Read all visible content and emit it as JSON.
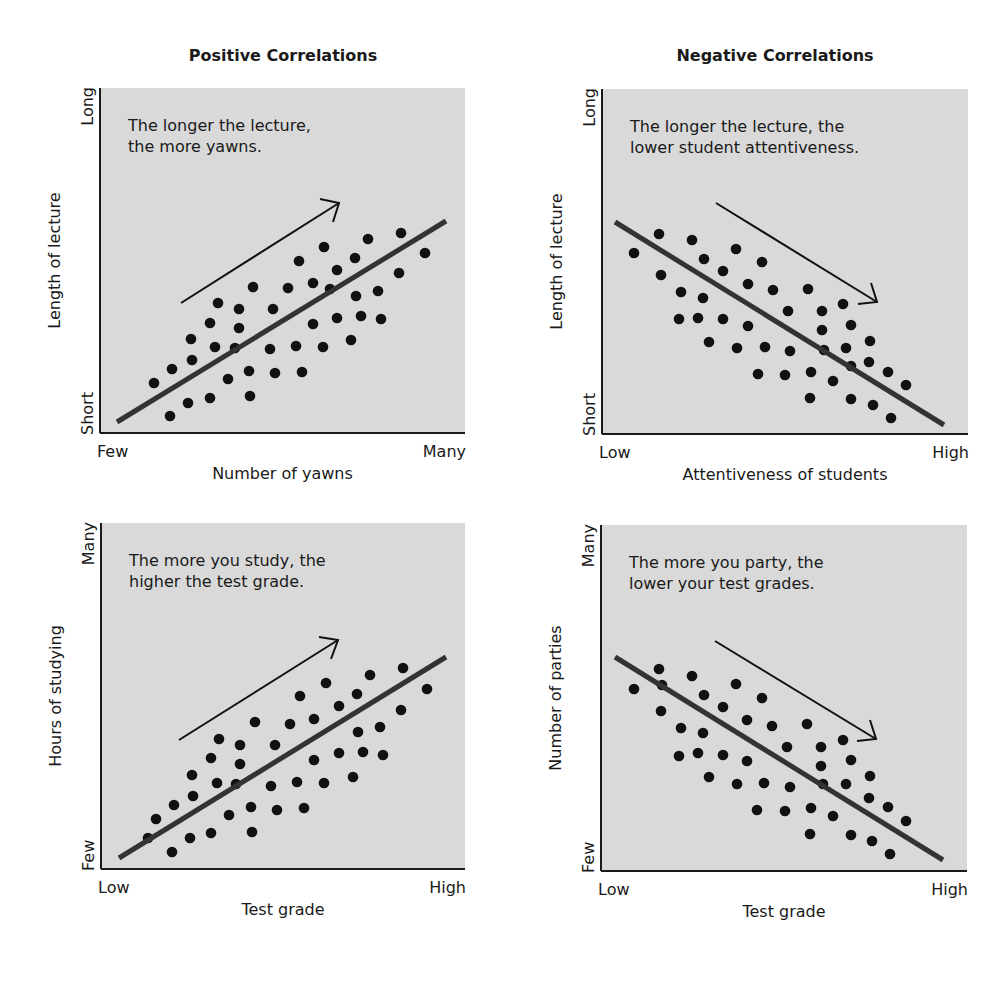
{
  "columns": [
    {
      "title": "Positive Correlations"
    },
    {
      "title": "Negative Correlations"
    }
  ],
  "style": {
    "panel_bg": "#d9d9d9",
    "axis_color": "#1a1a1a",
    "trend_color": "#333333",
    "dot_color": "#111111",
    "arrow_color": "#111111"
  },
  "chart_data": [
    {
      "type": "scatter",
      "id": "top-left",
      "group": "Positive Correlations",
      "annotation": [
        "The longer the lecture,",
        "the more yawns."
      ],
      "xlabel": "Number of yawns",
      "ylabel": "Length of lecture",
      "x_ticks": [
        "Few",
        "Many"
      ],
      "y_ticks": [
        "Short",
        "Long"
      ],
      "plot": {
        "x0": 100,
        "y0": 88,
        "x1": 465,
        "y1": 433
      },
      "trend": [
        [
          117,
          422
        ],
        [
          446,
          221
        ]
      ],
      "arrow": {
        "from": [
          181,
          303
        ],
        "to": [
          339,
          203
        ],
        "wing1": [
          320,
          199
        ],
        "wing2": [
          333,
          222
        ]
      },
      "points": [
        [
          154,
          383
        ],
        [
          172,
          369
        ],
        [
          170,
          416
        ],
        [
          188,
          403
        ],
        [
          191,
          339
        ],
        [
          192,
          360
        ],
        [
          210,
          323
        ],
        [
          215,
          347
        ],
        [
          210,
          398
        ],
        [
          218,
          303
        ],
        [
          228,
          379
        ],
        [
          235,
          348
        ],
        [
          239,
          309
        ],
        [
          239,
          328
        ],
        [
          249,
          371
        ],
        [
          250,
          396
        ],
        [
          253,
          287
        ],
        [
          270,
          349
        ],
        [
          273,
          309
        ],
        [
          275,
          373
        ],
        [
          288,
          288
        ],
        [
          296,
          346
        ],
        [
          299,
          261
        ],
        [
          302,
          372
        ],
        [
          313,
          283
        ],
        [
          313,
          324
        ],
        [
          323,
          347
        ],
        [
          324,
          247
        ],
        [
          330,
          289
        ],
        [
          337,
          270
        ],
        [
          337,
          318
        ],
        [
          351,
          340
        ],
        [
          355,
          258
        ],
        [
          356,
          296
        ],
        [
          361,
          316
        ],
        [
          368,
          239
        ],
        [
          378,
          291
        ],
        [
          381,
          319
        ],
        [
          399,
          273
        ],
        [
          401,
          233
        ],
        [
          425,
          253
        ]
      ],
      "grid": false
    },
    {
      "type": "scatter",
      "id": "top-right",
      "group": "Negative Correlations",
      "annotation": [
        "The longer the lecture, the",
        "lower student attentiveness."
      ],
      "xlabel": "Attentiveness of students",
      "ylabel": "Length of lecture",
      "x_ticks": [
        "Low",
        "High"
      ],
      "y_ticks": [
        "Short",
        "Long"
      ],
      "plot": {
        "x0": 602,
        "y0": 89,
        "x1": 968,
        "y1": 434
      },
      "trend": [
        [
          615,
          222
        ],
        [
          944,
          425
        ]
      ],
      "arrow": {
        "from": [
          716,
          203
        ],
        "to": [
          877,
          302
        ],
        "wing1": [
          871,
          283
        ],
        "wing2": [
          858,
          304
        ]
      },
      "points": [
        [
          634,
          253
        ],
        [
          659,
          234
        ],
        [
          661,
          275
        ],
        [
          681,
          292
        ],
        [
          679,
          319
        ],
        [
          692,
          240
        ],
        [
          698,
          318
        ],
        [
          703,
          298
        ],
        [
          704,
          259
        ],
        [
          709,
          342
        ],
        [
          723,
          271
        ],
        [
          723,
          319
        ],
        [
          736,
          249
        ],
        [
          737,
          348
        ],
        [
          748,
          284
        ],
        [
          748,
          326
        ],
        [
          758,
          374
        ],
        [
          762,
          262
        ],
        [
          765,
          347
        ],
        [
          773,
          290
        ],
        [
          785,
          375
        ],
        [
          788,
          311
        ],
        [
          790,
          351
        ],
        [
          808,
          289
        ],
        [
          810,
          398
        ],
        [
          811,
          372
        ],
        [
          822,
          311
        ],
        [
          822,
          330
        ],
        [
          824,
          350
        ],
        [
          833,
          381
        ],
        [
          843,
          304
        ],
        [
          846,
          348
        ],
        [
          851,
          325
        ],
        [
          851,
          366
        ],
        [
          851,
          399
        ],
        [
          869,
          362
        ],
        [
          870,
          341
        ],
        [
          873,
          405
        ],
        [
          888,
          372
        ],
        [
          891,
          418
        ],
        [
          906,
          385
        ]
      ],
      "grid": false
    },
    {
      "type": "scatter",
      "id": "bottom-left",
      "group": "Positive Correlations",
      "annotation": [
        "The more you study, the",
        "higher the test grade."
      ],
      "xlabel": "Test grade",
      "ylabel": "Hours of studying",
      "x_ticks": [
        "Low",
        "High"
      ],
      "y_ticks": [
        "Few",
        "Many"
      ],
      "plot": {
        "x0": 101,
        "y0": 523,
        "x1": 465,
        "y1": 869
      },
      "trend": [
        [
          119,
          858
        ],
        [
          446,
          657
        ]
      ],
      "arrow": {
        "from": [
          179,
          740
        ],
        "to": [
          338,
          640
        ],
        "wing1": [
          319,
          637
        ],
        "wing2": [
          331,
          659
        ]
      },
      "points": [
        [
          148,
          838
        ],
        [
          156,
          819
        ],
        [
          172,
          852
        ],
        [
          174,
          805
        ],
        [
          190,
          838
        ],
        [
          192,
          775
        ],
        [
          193,
          796
        ],
        [
          211,
          833
        ],
        [
          211,
          758
        ],
        [
          217,
          783
        ],
        [
          219,
          739
        ],
        [
          229,
          815
        ],
        [
          236,
          784
        ],
        [
          240,
          745
        ],
        [
          240,
          764
        ],
        [
          251,
          807
        ],
        [
          252,
          832
        ],
        [
          255,
          722
        ],
        [
          271,
          786
        ],
        [
          275,
          745
        ],
        [
          277,
          810
        ],
        [
          290,
          724
        ],
        [
          297,
          782
        ],
        [
          300,
          696
        ],
        [
          304,
          808
        ],
        [
          314,
          719
        ],
        [
          314,
          760
        ],
        [
          324,
          783
        ],
        [
          326,
          683
        ],
        [
          339,
          706
        ],
        [
          339,
          753
        ],
        [
          353,
          777
        ],
        [
          357,
          694
        ],
        [
          358,
          732
        ],
        [
          363,
          752
        ],
        [
          370,
          675
        ],
        [
          380,
          727
        ],
        [
          383,
          755
        ],
        [
          401,
          710
        ],
        [
          403,
          668
        ],
        [
          427,
          689
        ]
      ],
      "grid": false
    },
    {
      "type": "scatter",
      "id": "bottom-right",
      "group": "Negative Correlations",
      "annotation": [
        "The more you party, the",
        "lower your test grades."
      ],
      "xlabel": "Test grade",
      "ylabel": "Number of parties",
      "x_ticks": [
        "Low",
        "High"
      ],
      "y_ticks": [
        "Few",
        "Many"
      ],
      "plot": {
        "x0": 601,
        "y0": 525,
        "x1": 967,
        "y1": 871
      },
      "trend": [
        [
          615,
          657
        ],
        [
          943,
          860
        ]
      ],
      "arrow": {
        "from": [
          715,
          641
        ],
        "to": [
          876,
          739
        ],
        "wing1": [
          870,
          720
        ],
        "wing2": [
          857,
          741
        ]
      },
      "points": [
        [
          634,
          689
        ],
        [
          659,
          669
        ],
        [
          662,
          685
        ],
        [
          661,
          711
        ],
        [
          681,
          728
        ],
        [
          679,
          756
        ],
        [
          692,
          676
        ],
        [
          698,
          753
        ],
        [
          703,
          733
        ],
        [
          704,
          695
        ],
        [
          709,
          777
        ],
        [
          723,
          707
        ],
        [
          723,
          755
        ],
        [
          736,
          684
        ],
        [
          737,
          784
        ],
        [
          747,
          720
        ],
        [
          747,
          761
        ],
        [
          757,
          810
        ],
        [
          762,
          698
        ],
        [
          764,
          783
        ],
        [
          772,
          726
        ],
        [
          785,
          811
        ],
        [
          787,
          747
        ],
        [
          790,
          787
        ],
        [
          807,
          724
        ],
        [
          810,
          834
        ],
        [
          811,
          808
        ],
        [
          821,
          747
        ],
        [
          821,
          766
        ],
        [
          823,
          784
        ],
        [
          833,
          816
        ],
        [
          843,
          740
        ],
        [
          846,
          784
        ],
        [
          851,
          760
        ],
        [
          851,
          835
        ],
        [
          869,
          798
        ],
        [
          870,
          776
        ],
        [
          872,
          841
        ],
        [
          888,
          807
        ],
        [
          890,
          854
        ],
        [
          906,
          821
        ]
      ],
      "grid": false
    }
  ]
}
